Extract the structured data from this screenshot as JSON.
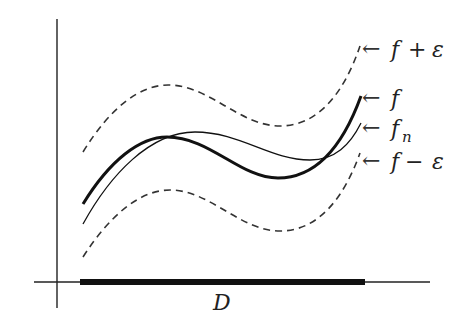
{
  "diagram": {
    "domain_label": "D",
    "curves": [
      {
        "id": "upper-band",
        "label": "f + ε",
        "label_parts": [
          "f",
          "+",
          "ε"
        ],
        "style": "dashed"
      },
      {
        "id": "f",
        "label": "f",
        "style": "thick"
      },
      {
        "id": "fn",
        "label": "f",
        "subscript": "n",
        "style": "thin"
      },
      {
        "id": "lower-band",
        "label": "f − ε",
        "label_parts": [
          "f",
          "−",
          "ε"
        ],
        "style": "dashed"
      }
    ],
    "arrow_glyph": "←",
    "colors": {
      "stroke": "#111111",
      "dashed": "#333333",
      "background": "#ffffff"
    }
  }
}
